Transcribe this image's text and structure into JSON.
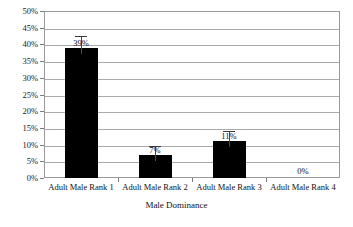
{
  "chart_data": {
    "type": "bar",
    "title": "",
    "xlabel": "Male Dominance",
    "ylabel": "",
    "categories": [
      "Adult Male Rank 1",
      "Adult Male Rank 2",
      "Adult Male Rank 3",
      "Adult Male Rank 4"
    ],
    "values": [
      39,
      7,
      11,
      0
    ],
    "value_labels": [
      "39%",
      "7%",
      "11%",
      "0%"
    ],
    "errors": [
      3.5,
      2.5,
      3.0,
      0
    ],
    "ylim": [
      0,
      50
    ],
    "ytick_values": [
      0,
      5,
      10,
      15,
      20,
      25,
      30,
      35,
      40,
      45,
      50
    ],
    "ytick_labels": [
      "0%",
      "5%",
      "10%",
      "15%",
      "20%",
      "25%",
      "30%",
      "35%",
      "40%",
      "45%",
      "50%"
    ],
    "grid": true,
    "legend": false,
    "bar_color": "#000000",
    "errorbar_color": "#3a3a3a",
    "gridline_color": "#aaaaaa",
    "plot_border_color": "#9a9a9a",
    "text_color": "#111111"
  }
}
